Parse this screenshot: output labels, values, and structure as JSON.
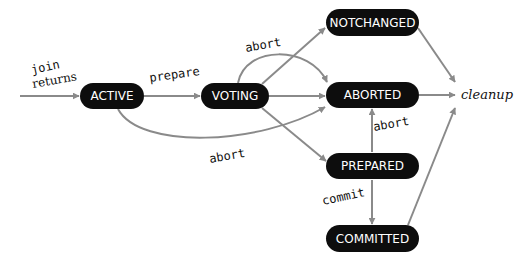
{
  "diagram": {
    "type": "state-transition",
    "colors": {
      "node_fill": "#0d0d0d",
      "node_text": "#ffffff",
      "edge": "#8a8a8a",
      "label": "#111111"
    },
    "nodes": [
      {
        "id": "active",
        "label": "ACTIVE"
      },
      {
        "id": "voting",
        "label": "VOTING"
      },
      {
        "id": "notchanged",
        "label": "NOTCHANGED"
      },
      {
        "id": "aborted",
        "label": "ABORTED"
      },
      {
        "id": "prepared",
        "label": "PREPARED"
      },
      {
        "id": "committed",
        "label": "COMMITTED"
      }
    ],
    "terminal": {
      "label": "cleanup"
    },
    "entry_labels": {
      "join": "join",
      "returns": "returns"
    },
    "edges": [
      {
        "from": "entry",
        "to": "active",
        "label": "join / returns"
      },
      {
        "from": "active",
        "to": "voting",
        "label": "prepare"
      },
      {
        "from": "active",
        "to": "aborted",
        "label": "abort"
      },
      {
        "from": "voting",
        "to": "notchanged",
        "label": ""
      },
      {
        "from": "voting",
        "to": "aborted",
        "label": "abort"
      },
      {
        "from": "voting",
        "to": "aborted",
        "label": ""
      },
      {
        "from": "voting",
        "to": "prepared",
        "label": ""
      },
      {
        "from": "prepared",
        "to": "aborted",
        "label": "abort"
      },
      {
        "from": "prepared",
        "to": "committed",
        "label": "commit"
      },
      {
        "from": "notchanged",
        "to": "cleanup",
        "label": ""
      },
      {
        "from": "aborted",
        "to": "cleanup",
        "label": ""
      },
      {
        "from": "committed",
        "to": "cleanup",
        "label": ""
      }
    ],
    "edge_labels": {
      "prepare": "prepare",
      "voting_abort": "abort",
      "active_abort": "abort",
      "prepared_abort": "abort",
      "commit": "commit"
    }
  }
}
